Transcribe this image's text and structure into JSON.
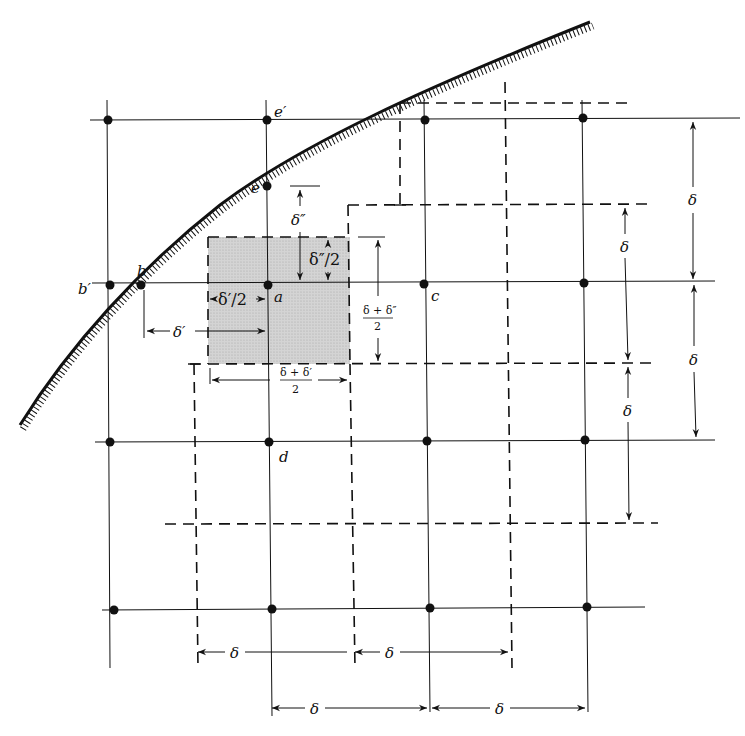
{
  "diagram": {
    "kind": "finite-difference grid near curved boundary",
    "colors": {
      "line": "#111111",
      "shade": "#cfcfcf",
      "background": "#ffffff"
    },
    "grid": {
      "columns_x": [
        108,
        267,
        425,
        583
      ],
      "rows_y": [
        120,
        283,
        440,
        608
      ]
    },
    "nodes": [
      {
        "id": "e_prime",
        "label": "e′",
        "x": 267,
        "y": 120
      },
      {
        "id": "e",
        "label": "e",
        "x": 267,
        "y": 186
      },
      {
        "id": "b_prime",
        "label": "b′",
        "x": 110,
        "y": 285
      },
      {
        "id": "b",
        "label": "b",
        "x": 141,
        "y": 285
      },
      {
        "id": "a",
        "label": "a",
        "x": 268,
        "y": 285
      },
      {
        "id": "c",
        "label": "c",
        "x": 424,
        "y": 284
      },
      {
        "id": "d",
        "label": "d",
        "x": 269,
        "y": 442
      }
    ],
    "dimension_labels": {
      "delta": "δ",
      "delta_prime": "δ′",
      "delta_dprime": "δ″",
      "delta_dprime_half": "δ″/2",
      "delta_prime_half": "δ′/2",
      "delta_plus_dprime_num": "δ + δ″",
      "delta_plus_prime_num": "δ + δ′",
      "denominator": "2"
    }
  }
}
